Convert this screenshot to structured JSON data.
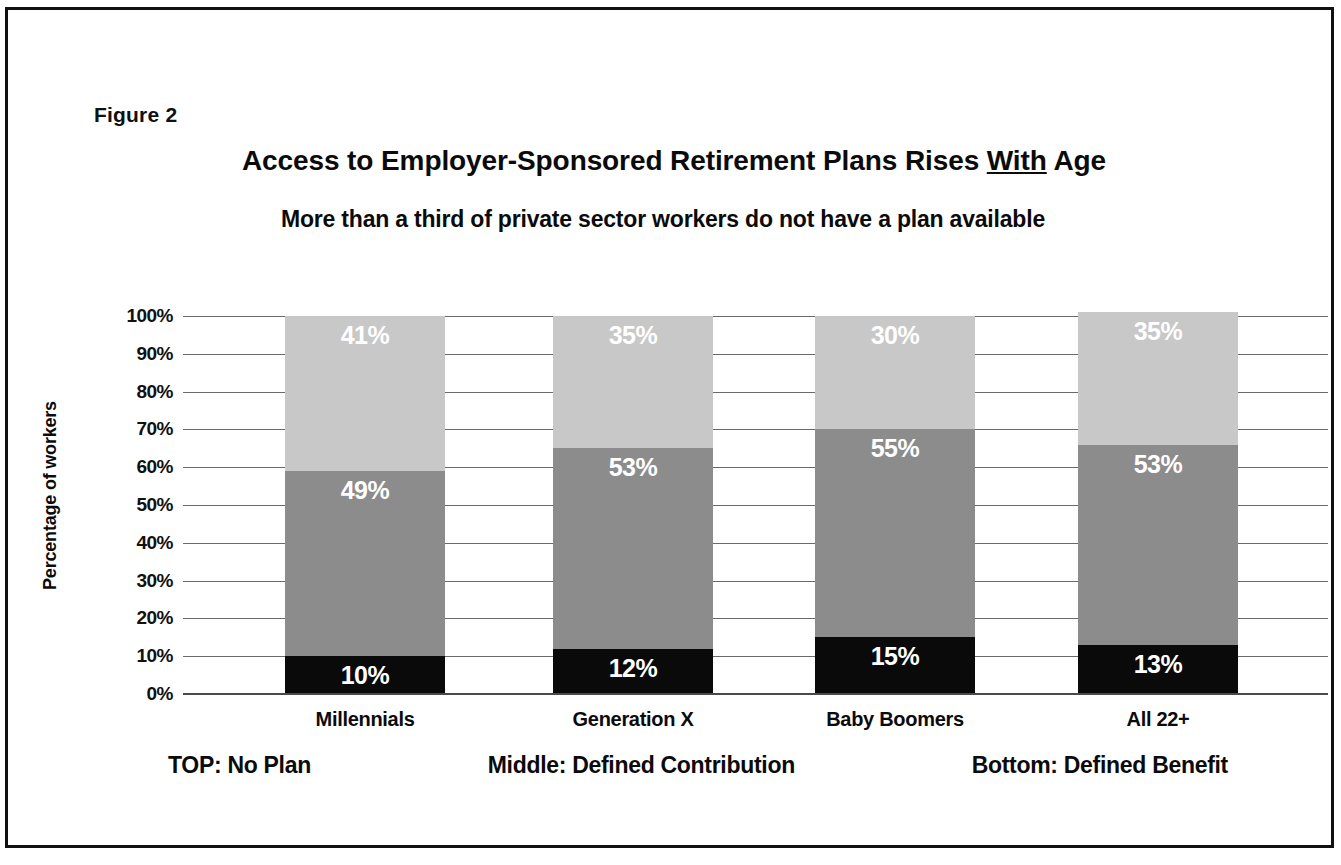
{
  "figure": {
    "number_label": "Figure 2",
    "title_before": "Access to Employer-Sponsored Retirement Plans Rises ",
    "title_emphasis": "With",
    "title_after": " Age",
    "title_full": "Access to Employer-Sponsored Retirement Plans Rises With Age",
    "subtitle": "More than a third of private sector workers do not have a plan available"
  },
  "legend": {
    "top": "TOP: No Plan",
    "middle": "Middle: Defined Contribution",
    "bottom": "Bottom: Defined Benefit"
  },
  "colors": {
    "no_plan": "#c8c8c8",
    "defined_contribution": "#8c8c8c",
    "defined_benefit": "#0a0a0a",
    "gridline": "#6a6a6a",
    "text": "#0b0b0b",
    "frame": "#111111"
  },
  "chart_data": {
    "type": "bar",
    "subtype": "stacked-vertical-100",
    "title": "Access to Employer-Sponsored Retirement Plans Rises With Age",
    "subtitle": "More than a third of private sector workers do not have a plan available",
    "xlabel": "",
    "ylabel": "Percentage of workers",
    "ylim": [
      0,
      100
    ],
    "ytick_values": [
      0,
      10,
      20,
      30,
      40,
      50,
      60,
      70,
      80,
      90,
      100
    ],
    "ytick_labels": [
      "0%",
      "10%",
      "20%",
      "30%",
      "40%",
      "50%",
      "60%",
      "70%",
      "80%",
      "90%",
      "100%"
    ],
    "grid": true,
    "legend_position": "below-plot",
    "categories": [
      "Millennials",
      "Generation X",
      "Baby Boomers",
      "All 22+"
    ],
    "series": [
      {
        "name": "No Plan",
        "stack_position": "top",
        "color": "#c8c8c8",
        "values": [
          41,
          35,
          30,
          35
        ],
        "labels": [
          "41%",
          "35%",
          "30%",
          "35%"
        ]
      },
      {
        "name": "Defined Contribution",
        "stack_position": "middle",
        "color": "#8c8c8c",
        "values": [
          49,
          53,
          55,
          53
        ],
        "labels": [
          "49%",
          "53%",
          "55%",
          "53%"
        ]
      },
      {
        "name": "Defined Benefit",
        "stack_position": "bottom",
        "color": "#0a0a0a",
        "values": [
          10,
          12,
          15,
          13
        ],
        "labels": [
          "10%",
          "12%",
          "15%",
          "13%"
        ]
      }
    ]
  }
}
